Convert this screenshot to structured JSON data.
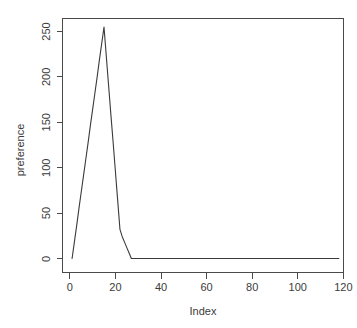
{
  "chart_data": {
    "type": "line",
    "title": "",
    "xlabel": "Index",
    "ylabel": "preference",
    "xlim": [
      0,
      120
    ],
    "ylim": [
      -8,
      268
    ],
    "grid": false,
    "legend": null,
    "box": "full",
    "line_color": "#3a3a3a",
    "background": "#ffffff",
    "xticks": [
      0,
      20,
      40,
      60,
      80,
      100,
      120
    ],
    "xtick_labels": [
      "0",
      "20",
      "40",
      "60",
      "80",
      "100",
      "120"
    ],
    "yticks": [
      0,
      50,
      100,
      150,
      200,
      250
    ],
    "ytick_labels": [
      "0",
      "50",
      "100",
      "150",
      "200",
      "250"
    ],
    "series": [
      {
        "name": "preference",
        "x": [
          1,
          2,
          3,
          4,
          5,
          6,
          7,
          8,
          9,
          10,
          11,
          12,
          13,
          14,
          15,
          16,
          17,
          18,
          19,
          20,
          21,
          22,
          23,
          24,
          25,
          26,
          27,
          28,
          30,
          35,
          40,
          45,
          50,
          55,
          60,
          65,
          70,
          75,
          80,
          85,
          90,
          95,
          100,
          105,
          110,
          114,
          118
        ],
        "y": [
          0,
          18,
          36,
          55,
          73,
          91,
          109,
          127,
          146,
          164,
          182,
          200,
          219,
          237,
          255,
          223,
          191,
          159,
          128,
          96,
          64,
          32,
          24,
          18,
          12,
          6,
          0,
          0,
          0,
          0,
          0,
          0,
          0,
          0,
          0,
          0,
          0,
          0,
          0,
          0,
          0,
          0,
          0,
          0,
          0,
          0,
          0
        ]
      }
    ],
    "peak": {
      "x": 15,
      "y": 255
    }
  },
  "axis_titles": {
    "x": "Index",
    "y": "preference"
  }
}
